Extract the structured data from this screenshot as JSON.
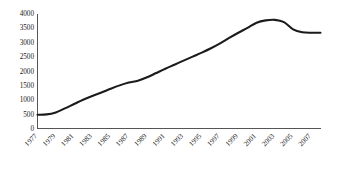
{
  "chart_data": {
    "type": "line",
    "title": "",
    "subtitle": "",
    "xlabel": "",
    "ylabel": "",
    "grid": false,
    "legend": false,
    "legend_position": "none",
    "line_color": "#1b1b1b",
    "axis_color": "#555555",
    "background_color": "#ffffff",
    "xlim": [
      1977,
      2008
    ],
    "ylim": [
      0,
      4000
    ],
    "ytick_values": [
      0,
      500,
      1000,
      1500,
      2000,
      2500,
      3000,
      3500,
      4000
    ],
    "ytick_labels": [
      "0",
      "500",
      "1000",
      "1500",
      "2000",
      "2500",
      "3000",
      "3500",
      "4000"
    ],
    "xtick_values": [
      1977,
      1979,
      1981,
      1983,
      1985,
      1987,
      1989,
      1991,
      1993,
      1995,
      1997,
      1999,
      2001,
      2003,
      2005,
      2007
    ],
    "xtick_labels": [
      "1977",
      "1979",
      "1981",
      "1983",
      "1985",
      "1987",
      "1989",
      "1991",
      "1993",
      "1995",
      "1997",
      "1999",
      "2001",
      "2003",
      "2005",
      "2007"
    ],
    "x": [
      1977,
      1978,
      1979,
      1980,
      1981,
      1982,
      1983,
      1984,
      1985,
      1986,
      1987,
      1988,
      1989,
      1990,
      1991,
      1992,
      1993,
      1994,
      1995,
      1996,
      1997,
      1998,
      1999,
      2000,
      2001,
      2002,
      2003,
      2004,
      2005,
      2006,
      2007,
      2008
    ],
    "values": [
      480,
      490,
      560,
      700,
      850,
      1000,
      1130,
      1250,
      1380,
      1500,
      1600,
      1660,
      1780,
      1930,
      2080,
      2220,
      2360,
      2500,
      2640,
      2790,
      2960,
      3150,
      3330,
      3500,
      3680,
      3760,
      3780,
      3700,
      3450,
      3350,
      3330,
      3330
    ]
  }
}
